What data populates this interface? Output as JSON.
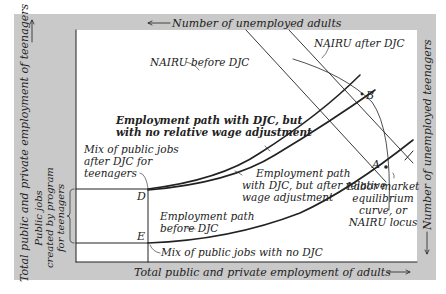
{
  "axes": {
    "top": "Number of unemployed adults",
    "bottom": "Total public and private employment of adults",
    "left": "Total public and private employment of teenagers",
    "right": "Number of unemployed teenagers"
  },
  "left_bracket_label": [
    "Public jobs",
    "created by program",
    "for teenagers"
  ],
  "curves": {
    "nairu_before": "NAIRU before DJC",
    "nairu_after": "NAIRU after DJC",
    "path_no_adjust": [
      "Employment path with DJC, but",
      "with no relative wage adjustment"
    ],
    "path_after_adjust": [
      "Employment path",
      "with DJC, but after relative",
      "wage adjustment"
    ],
    "path_before": [
      "Employment path",
      "before DJC"
    ],
    "mix_after": [
      "Mix of public jobs",
      "after DJC for",
      "teenagers"
    ],
    "mix_no_djc": "Mix of public jobs with no DJC",
    "equilibrium": [
      "Labor market",
      "equilibrium",
      "curve, or",
      "NAIRU locus"
    ]
  },
  "points": {
    "A": "A",
    "B": "B",
    "D": "D",
    "E": "E"
  }
}
